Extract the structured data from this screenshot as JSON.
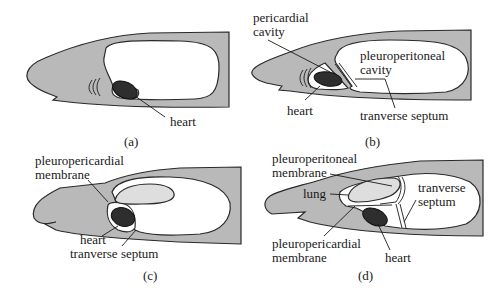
{
  "figure": {
    "panels": [
      {
        "id": "a",
        "caption": "(a)",
        "labels": {
          "heart": "heart"
        }
      },
      {
        "id": "b",
        "caption": "(b)",
        "labels": {
          "pericardial_cavity_line1": "pericardial",
          "pericardial_cavity_line2": "cavity",
          "pleuroperitoneal_cavity_line1": "pleuroperitoneal",
          "pleuroperitoneal_cavity_line2": "cavity",
          "heart": "heart",
          "transverse_septum": "tranverse septum"
        }
      },
      {
        "id": "c",
        "caption": "(c)",
        "labels": {
          "pleuropericardial_membrane_line1": "pleuropericardial",
          "pleuropericardial_membrane_line2": "membrane",
          "heart": "heart",
          "transverse_septum": "tranverse septum"
        }
      },
      {
        "id": "d",
        "caption": "(d)",
        "labels": {
          "pleuroperitoneal_membrane_line1": "pleuroperitoneal",
          "pleuroperitoneal_membrane_line2": "membrane",
          "lung": "lung",
          "transverse_septum_line1": "tranverse",
          "transverse_septum_line2": "septum",
          "pleuropericardial_membrane_line1": "pleuropericardial",
          "pleuropericardial_membrane_line2": "membrane",
          "heart": "heart"
        }
      }
    ],
    "colors": {
      "body": "#b9b9b9",
      "cavity": "#ffffff",
      "heart": "#2e2e2e",
      "lung": "#dedede",
      "outline": "#2a2a2a"
    }
  }
}
